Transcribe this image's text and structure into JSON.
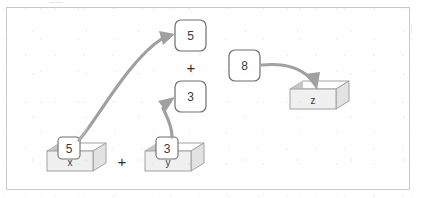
{
  "diagram": {
    "frame": {
      "border_color": "#c9c9c9",
      "background": "#fefefe"
    },
    "palette": {
      "card_fill": "#ffffff",
      "card_stroke": "#6e6e6e",
      "box_top_fill": "#ffffff",
      "box_front_fill": "#f0f0f0",
      "box_side_fill": "#e2e2e2",
      "box_inner_shadow": "#c6c6c6",
      "box_stroke": "#9a9a9a",
      "arrow_color": "#a0a0a0",
      "text_color": "#3b3b3b",
      "operator_color": "#2e2e2e"
    },
    "boxes": [
      {
        "id": "box-x",
        "label": "x",
        "holds_value": "5"
      },
      {
        "id": "box-y",
        "label": "y",
        "holds_value": "3"
      },
      {
        "id": "box-z",
        "label": "z",
        "holds_value": ""
      }
    ],
    "cards": [
      {
        "id": "card-x-value",
        "value": "5",
        "location": "inside-box-x"
      },
      {
        "id": "card-y-value",
        "value": "3",
        "location": "inside-box-y"
      },
      {
        "id": "card-operand-left",
        "value": "5",
        "location": "expression-top"
      },
      {
        "id": "card-operand-right",
        "value": "3",
        "location": "expression-bottom"
      },
      {
        "id": "card-result",
        "value": "8",
        "location": "result"
      }
    ],
    "operators": [
      {
        "id": "operator-boxes",
        "symbol": "+",
        "between": "x and y"
      },
      {
        "id": "operator-expression",
        "symbol": "+",
        "between": "5 and 3"
      }
    ],
    "arrows": [
      {
        "id": "arrow-x-to-operand",
        "from": "card-x-value",
        "to": "card-operand-left"
      },
      {
        "id": "arrow-y-to-operand",
        "from": "card-y-value",
        "to": "card-operand-right"
      },
      {
        "id": "arrow-result-to-z",
        "from": "card-result",
        "to": "box-z"
      }
    ]
  }
}
